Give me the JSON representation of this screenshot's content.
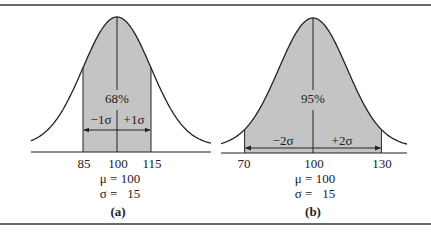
{
  "figure": {
    "panels": [
      {
        "id": "a",
        "caption": "(a)",
        "shaded_percent": "68%",
        "left_sigma_label": "−1σ",
        "right_sigma_label": "+1σ",
        "ticks": [
          "85",
          "100",
          "115"
        ],
        "mu_label": "μ = 100",
        "sigma_label": "σ =   15"
      },
      {
        "id": "b",
        "caption": "(b)",
        "shaded_percent": "95%",
        "left_sigma_label": "−2σ",
        "right_sigma_label": "+2σ",
        "ticks": [
          "70",
          "100",
          "130"
        ],
        "mu_label": "μ = 100",
        "sigma_label": "σ =   15"
      }
    ],
    "colors": {
      "shade": "#c4c4c4",
      "line": "#222222",
      "rule": "#6a6a6a"
    }
  },
  "chart_data": [
    {
      "type": "area",
      "title": "(a)",
      "distribution": "normal",
      "mean": 100,
      "sd": 15,
      "shaded_range": [
        85,
        115
      ],
      "shaded_percent": 68,
      "x_ticks": [
        85,
        100,
        115
      ],
      "annotations": [
        "68%",
        "−1σ",
        "+1σ",
        "μ = 100",
        "σ = 15"
      ]
    },
    {
      "type": "area",
      "title": "(b)",
      "distribution": "normal",
      "mean": 100,
      "sd": 15,
      "shaded_range": [
        70,
        130
      ],
      "shaded_percent": 95,
      "x_ticks": [
        70,
        100,
        130
      ],
      "annotations": [
        "95%",
        "−2σ",
        "+2σ",
        "μ = 100",
        "σ = 15"
      ]
    }
  ]
}
